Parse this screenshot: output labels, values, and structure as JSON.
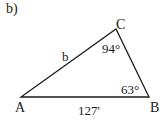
{
  "problem_label": "b)",
  "vertices": {
    "A": {
      "label": "A"
    },
    "B": {
      "label": "B"
    },
    "C": {
      "label": "C"
    }
  },
  "angles": {
    "C": "94°",
    "B": "63°"
  },
  "sides": {
    "AC": "b",
    "AB": "127'"
  },
  "colors": {
    "line": "#1a1a1a",
    "background": "#ffffff"
  }
}
